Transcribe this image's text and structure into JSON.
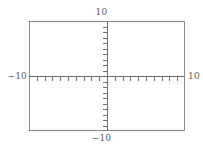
{
  "chart_data": {
    "type": "line",
    "title": "",
    "subtitle": "",
    "xlabel": "",
    "ylabel": "",
    "xlim": [
      -10,
      10
    ],
    "ylim": [
      -10,
      10
    ],
    "grid": false,
    "legend": null,
    "series": [],
    "axes": {
      "x": {
        "min": -10,
        "max": 10,
        "tick_step": 1,
        "tick_values": [
          -9,
          -8,
          -7,
          -6,
          -5,
          -4,
          -3,
          -2,
          -1,
          1,
          2,
          3,
          4,
          5,
          6,
          7,
          8,
          9
        ],
        "min_label": "−10",
        "max_label": "10"
      },
      "y": {
        "min": -10,
        "max": 10,
        "tick_step": 1,
        "tick_values": [
          -9,
          -8,
          -7,
          -6,
          -5,
          -4,
          -3,
          -2,
          -1,
          1,
          2,
          3,
          4,
          5,
          6,
          7,
          8,
          9
        ],
        "min_label": "−10",
        "max_label": "10"
      }
    },
    "annotations": []
  },
  "labels": {
    "y_max": "10",
    "y_min": "−10",
    "x_min": "−10",
    "x_max": "10"
  },
  "colors": {
    "frame": "#8b8b8b",
    "axis": "#6e6e6e",
    "text": "#5a5a5a",
    "background": "#ffffff"
  }
}
